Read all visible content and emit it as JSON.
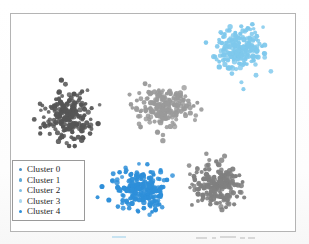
{
  "figure": {
    "background_color": "#ffffff",
    "frame_color": "#b4b4b4",
    "has_axis_ticks": false,
    "has_axis_labels": false
  },
  "legend": {
    "position": "lower left",
    "border_color": "#9a9a9a",
    "background_color": "#ffffff",
    "entries": [
      {
        "label": "Cluster 0",
        "marker_color": "#4a90c4",
        "icon": "circle-marker-icon"
      },
      {
        "label": "Cluster 1",
        "marker_color": "#5fa9d6",
        "icon": "circle-marker-icon"
      },
      {
        "label": "Cluster 2",
        "marker_color": "#7dbde2",
        "icon": "circle-marker-icon"
      },
      {
        "label": "Cluster 3",
        "marker_color": "#a9d6ee",
        "icon": "circle-marker-icon"
      },
      {
        "label": "Cluster 4",
        "marker_color": "#2e8fd9",
        "icon": "circle-marker-icon"
      }
    ]
  },
  "chart_data": {
    "type": "scatter",
    "title": "",
    "xlabel": "",
    "ylabel": "",
    "xlim": [
      0,
      286
    ],
    "ylim": [
      0,
      219
    ],
    "grid": false,
    "legend_position": "lower left",
    "marker_size": 2.3,
    "points_per_series": 200,
    "series": [
      {
        "name": "Cluster 0",
        "color": "#555555",
        "center": [
          58,
          102
        ],
        "spread": [
          24,
          22
        ],
        "seed": 11
      },
      {
        "name": "Cluster 1",
        "color": "#808080",
        "center": [
          208,
          173
        ],
        "spread": [
          26,
          20
        ],
        "seed": 27
      },
      {
        "name": "Cluster 2",
        "color": "#9a9a9a",
        "center": [
          155,
          94
        ],
        "spread": [
          25,
          19
        ],
        "seed": 43
      },
      {
        "name": "Cluster 3",
        "color": "#7ec8ec",
        "center": [
          230,
          35
        ],
        "spread": [
          24,
          19
        ],
        "seed": 59
      },
      {
        "name": "Cluster 4",
        "color": "#2e8fd9",
        "center": [
          130,
          177
        ],
        "spread": [
          25,
          20
        ],
        "seed": 71
      }
    ]
  },
  "scan_artifacts": [
    {
      "left": 112,
      "top": 3,
      "width": 14,
      "blue": true
    },
    {
      "left": 196,
      "top": 4,
      "width": 11,
      "blue": false
    },
    {
      "left": 212,
      "top": 4,
      "width": 4,
      "blue": false
    },
    {
      "left": 220,
      "top": 3,
      "width": 16,
      "blue": false
    },
    {
      "left": 240,
      "top": 4,
      "width": 5,
      "blue": false
    },
    {
      "left": 248,
      "top": 4,
      "width": 7,
      "blue": false
    }
  ]
}
